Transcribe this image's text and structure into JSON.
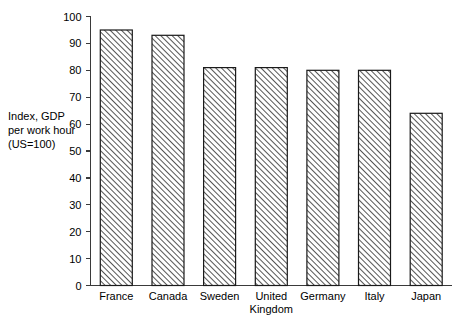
{
  "chart_data": {
    "type": "bar",
    "title": "",
    "subtitle": "",
    "xlabel": "",
    "ylabel": "Index, GDP per work hour (US=100)",
    "ylabel_lines": [
      "Index, GDP",
      "per work hour",
      "(US=100)"
    ],
    "categories": [
      "France",
      "Canada",
      "Sweden",
      "United Kingdom",
      "Germany",
      "Italy",
      "Japan"
    ],
    "category_lines": [
      [
        "France"
      ],
      [
        "Canada"
      ],
      [
        "Sweden"
      ],
      [
        "United",
        "Kingdom"
      ],
      [
        "Germany"
      ],
      [
        "Italy"
      ],
      [
        "Japan"
      ]
    ],
    "values": [
      95,
      93,
      81,
      81,
      80,
      80,
      64
    ],
    "ylim": [
      0,
      100
    ],
    "ytick_step": 10,
    "ytick_labels": [
      "0",
      "10",
      "20",
      "30",
      "40",
      "50",
      "60",
      "70",
      "80",
      "90",
      "100"
    ],
    "ytick_values": [
      0,
      10,
      20,
      30,
      40,
      50,
      60,
      70,
      80,
      90,
      100
    ],
    "grid": false,
    "legend": null,
    "legend_position": "none",
    "bar_fill_pattern": "diagonal-hatch",
    "bar_fill_color": "#ffffff",
    "bar_edge_color": "#1a1a1a",
    "hatch_color": "#2b2b2b",
    "axis_color": "#3a3a3a",
    "background_color": "#ffffff"
  }
}
